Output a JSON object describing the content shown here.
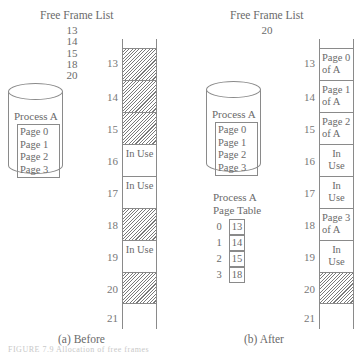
{
  "before": {
    "caption": "(a) Before",
    "free_frame_list": {
      "title": "Free Frame List",
      "frames": [
        "13",
        "14",
        "15",
        "18",
        "20"
      ]
    },
    "process": {
      "name": "Process A",
      "pages": [
        "Page 0",
        "Page 1",
        "Page 2",
        "Page 3"
      ]
    },
    "memory": {
      "frames": [
        {
          "number": "13",
          "state": "free",
          "label": ""
        },
        {
          "number": "14",
          "state": "free",
          "label": ""
        },
        {
          "number": "15",
          "state": "free",
          "label": ""
        },
        {
          "number": "16",
          "state": "in-use",
          "label": "In Use"
        },
        {
          "number": "17",
          "state": "in-use",
          "label": "In Use"
        },
        {
          "number": "18",
          "state": "free",
          "label": ""
        },
        {
          "number": "19",
          "state": "in-use",
          "label": "In Use"
        },
        {
          "number": "20",
          "state": "free",
          "label": ""
        },
        {
          "number": "21",
          "state": "open",
          "label": ""
        }
      ]
    }
  },
  "after": {
    "caption": "(b) After",
    "free_frame_list": {
      "title": "Free Frame List",
      "frames": [
        "20"
      ]
    },
    "process": {
      "name": "Process A",
      "pages": [
        "Page 0",
        "Page 1",
        "Page 2",
        "Page 3"
      ]
    },
    "page_table": {
      "title_line1": "Process A",
      "title_line2": "Page Table",
      "entries": [
        {
          "page": "0",
          "frame": "13"
        },
        {
          "page": "1",
          "frame": "14"
        },
        {
          "page": "2",
          "frame": "15"
        },
        {
          "page": "3",
          "frame": "18"
        }
      ]
    },
    "memory": {
      "frames": [
        {
          "number": "13",
          "state": "page",
          "line1": "Page 0",
          "line2": "of A"
        },
        {
          "number": "14",
          "state": "page",
          "line1": "Page 1",
          "line2": "of A"
        },
        {
          "number": "15",
          "state": "page",
          "line1": "Page 2",
          "line2": "of A"
        },
        {
          "number": "16",
          "state": "in-use",
          "line1": "In",
          "line2": "Use"
        },
        {
          "number": "17",
          "state": "in-use",
          "line1": "In",
          "line2": "Use"
        },
        {
          "number": "18",
          "state": "page",
          "line1": "Page 3",
          "line2": "of A"
        },
        {
          "number": "19",
          "state": "in-use",
          "line1": "In",
          "line2": "Use"
        },
        {
          "number": "20",
          "state": "free",
          "line1": "",
          "line2": ""
        },
        {
          "number": "21",
          "state": "open",
          "line1": "",
          "line2": ""
        }
      ]
    }
  },
  "footer_fragment": "FIGURE 7.9  Allocation of free frames"
}
